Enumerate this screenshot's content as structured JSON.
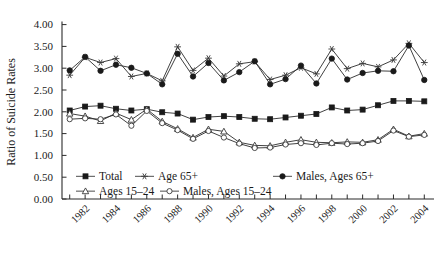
{
  "chart_data": {
    "type": "line",
    "title": "",
    "xlabel": "",
    "ylabel": "Ratio of Suicide Rates",
    "ylim": [
      0.0,
      4.0
    ],
    "ytick_labels": [
      "0.00",
      "0.50",
      "1.00",
      "1.50",
      "2.00",
      "2.50",
      "3.00",
      "3.50",
      "4.00"
    ],
    "ytick_values": [
      0.0,
      0.5,
      1.0,
      1.5,
      2.0,
      2.5,
      3.0,
      3.5,
      4.0
    ],
    "grid": false,
    "legend_position": "inside-lower-left",
    "x": [
      1981,
      1982,
      1983,
      1984,
      1985,
      1986,
      1987,
      1988,
      1989,
      1990,
      1991,
      1992,
      1993,
      1994,
      1995,
      1996,
      1997,
      1998,
      1999,
      2000,
      2001,
      2002,
      2003,
      2004
    ],
    "xtick_labels": [
      "1982",
      "1984",
      "1986",
      "1988",
      "1990",
      "1992",
      "1994",
      "1996",
      "1998",
      "2000",
      "2002",
      "2004"
    ],
    "xtick_label_values": [
      1982,
      1984,
      1986,
      1988,
      1990,
      1992,
      1994,
      1996,
      1998,
      2000,
      2002,
      2004
    ],
    "series": [
      {
        "name": "Total",
        "marker": "filled-square",
        "values": [
          2.03,
          2.12,
          2.14,
          2.07,
          2.03,
          2.06,
          1.99,
          1.96,
          1.82,
          1.88,
          1.9,
          1.88,
          1.84,
          1.83,
          1.87,
          1.91,
          1.95,
          2.1,
          2.03,
          2.05,
          2.15,
          2.25,
          2.25,
          2.24
        ]
      },
      {
        "name": "Age 65+",
        "marker": "star",
        "values": [
          2.84,
          3.25,
          3.13,
          3.22,
          2.81,
          2.88,
          2.71,
          3.49,
          2.95,
          3.23,
          2.82,
          3.1,
          3.15,
          2.74,
          2.84,
          3.01,
          2.87,
          3.44,
          2.99,
          3.11,
          3.03,
          3.19,
          3.57,
          3.13
        ]
      },
      {
        "name": "Males, Ages 65+",
        "marker": "filled-circle",
        "values": [
          2.95,
          3.26,
          2.94,
          3.08,
          3.01,
          2.88,
          2.63,
          3.33,
          2.81,
          3.12,
          2.72,
          2.91,
          3.16,
          2.63,
          2.75,
          3.06,
          2.65,
          3.22,
          2.74,
          2.89,
          2.94,
          2.93,
          3.52,
          2.73
        ]
      },
      {
        "name": "Ages 15–24",
        "marker": "open-triangle",
        "values": [
          1.96,
          1.9,
          1.79,
          1.97,
          1.82,
          2.06,
          1.78,
          1.61,
          1.41,
          1.6,
          1.55,
          1.3,
          1.23,
          1.22,
          1.3,
          1.36,
          1.3,
          1.29,
          1.31,
          1.3,
          1.36,
          1.6,
          1.44,
          1.5
        ]
      },
      {
        "name": "Males, Ages 15–24",
        "marker": "open-circle",
        "values": [
          1.83,
          1.85,
          1.83,
          1.94,
          1.68,
          2.02,
          1.74,
          1.58,
          1.38,
          1.56,
          1.41,
          1.27,
          1.17,
          1.18,
          1.25,
          1.28,
          1.24,
          1.28,
          1.26,
          1.28,
          1.33,
          1.57,
          1.43,
          1.47
        ]
      }
    ],
    "legend_rows": [
      [
        {
          "label": "Total",
          "marker": "filled-square"
        },
        {
          "label": "Age 65+",
          "marker": "star"
        },
        {
          "label": "Males, Ages 65+",
          "marker": "filled-circle"
        }
      ],
      [
        {
          "label": "Ages 15–24",
          "marker": "open-triangle"
        },
        {
          "label": "Males, Ages 15–24",
          "marker": "open-circle"
        }
      ]
    ]
  }
}
